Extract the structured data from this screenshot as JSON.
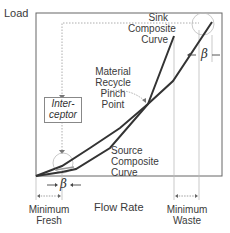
{
  "diagram": {
    "y_axis_label": "Load",
    "x_axis_label": "Flow Rate",
    "labels": {
      "sink_curve": [
        "Sink",
        "Composite",
        "Curve"
      ],
      "source_curve": [
        "Source",
        "Composite",
        "Curve"
      ],
      "pinch": [
        "Material",
        "Recycle",
        "Pinch",
        "Point"
      ],
      "interceptor": [
        "Inter-",
        "ceptor"
      ],
      "min_fresh": [
        "Minimum",
        "Fresh"
      ],
      "min_waste": [
        "Minimum",
        "Waste"
      ],
      "beta_bottom": "β",
      "beta_top": "β"
    },
    "colors": {
      "curve": "#333333",
      "frame": "#555555",
      "guide": "#aaaaaa"
    }
  }
}
